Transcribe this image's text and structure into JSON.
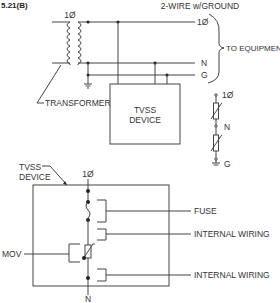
{
  "figure": {
    "label": "5.21(B)"
  },
  "top_diagram": {
    "title": "2-WIRE w/GROUND",
    "transformer_phase": "1Ø",
    "transformer_label": "TRANSFORMER",
    "lines": [
      {
        "id": "phase",
        "label": "1Ø"
      },
      {
        "id": "neutral",
        "label": "N"
      },
      {
        "id": "ground",
        "label": "G"
      }
    ],
    "brace_label": "TO EQUIPMENT",
    "device_label_line1": "TVSS",
    "device_label_line2": "DEVICE"
  },
  "schematic_symbol": {
    "top": "1Ø",
    "middle": "N",
    "bottom": "G"
  },
  "bottom_diagram": {
    "device_label_line1": "TVSS",
    "device_label_line2": "DEVICE",
    "top_terminal": "1Ø",
    "bottom_terminal": "N",
    "mov_label": "MOV",
    "callouts": [
      {
        "id": "fuse",
        "label": "FUSE"
      },
      {
        "id": "internal_wiring_1",
        "label": "INTERNAL WIRING"
      },
      {
        "id": "internal_wiring_2",
        "label": "INTERNAL WIRING"
      }
    ]
  },
  "colors": {
    "line": "#444444",
    "text": "#333333",
    "background": "#ffffff"
  }
}
